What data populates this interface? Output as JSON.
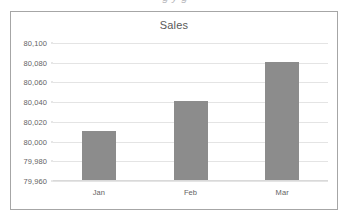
{
  "clipped_text_above": "g             y g",
  "chart_data": {
    "type": "bar",
    "title": "Sales",
    "xlabel": "",
    "ylabel": "",
    "categories": [
      "Jan",
      "Feb",
      "Mar"
    ],
    "values": [
      80010,
      80040,
      80080
    ],
    "ylim": [
      79960,
      80100
    ],
    "ytick_step": 20,
    "ytick_labels": [
      "80,100",
      "80,080",
      "80,060",
      "80,040",
      "80,020",
      "80,000",
      "79,980",
      "79,960"
    ],
    "ytick_values": [
      80100,
      80080,
      80060,
      80040,
      80020,
      80000,
      79980,
      79960
    ],
    "grid": true,
    "legend": false,
    "legend_position": "none",
    "series": [
      {
        "name": "Sales",
        "values": [
          80010,
          80040,
          80080
        ]
      }
    ]
  },
  "style": {
    "bar_color": "#8c8c8c",
    "gridline_color": "#e4e4e4",
    "frame_border_color": "#a6a6a6",
    "plot_background": "#ffffff",
    "title_color": "#595959",
    "tick_label_color": "#636363"
  }
}
